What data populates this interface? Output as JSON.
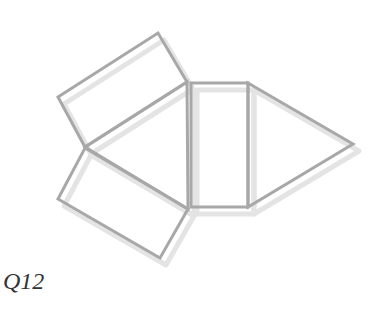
{
  "diagram": {
    "type": "net of triangular prism",
    "label": "Q12",
    "stroke_color": "#a8a8a8",
    "shadow_color": "#e4e4e4",
    "stroke_width": 3,
    "shapes": [
      {
        "name": "top-rectangle",
        "points": [
          [
            58,
            97
          ],
          [
            158,
            33
          ],
          [
            187,
            82
          ],
          [
            85,
            147
          ]
        ]
      },
      {
        "name": "left-triangle",
        "points": [
          [
            85,
            147
          ],
          [
            187,
            82
          ],
          [
            188,
            209
          ]
        ]
      },
      {
        "name": "bottom-rectangle",
        "points": [
          [
            85,
            148
          ],
          [
            188,
            209
          ],
          [
            160,
            258
          ],
          [
            58,
            199
          ]
        ]
      },
      {
        "name": "middle-rectangle",
        "points": [
          [
            191,
            83
          ],
          [
            248,
            83
          ],
          [
            248,
            207
          ],
          [
            191,
            207
          ]
        ]
      },
      {
        "name": "right-triangle",
        "points": [
          [
            248,
            83
          ],
          [
            353,
            144
          ],
          [
            248,
            207
          ]
        ]
      }
    ]
  }
}
